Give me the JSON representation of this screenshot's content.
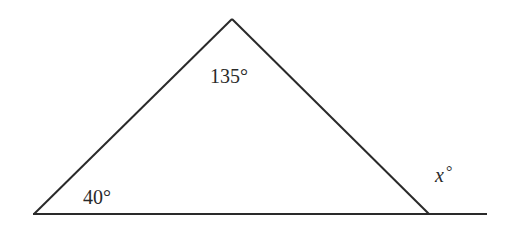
{
  "diagram": {
    "type": "geometry-triangle-exterior-angle",
    "stroke_color": "#2a2a2a",
    "background": "#ffffff",
    "vertices": {
      "apex": [
        232,
        19
      ],
      "bottom_left": [
        34,
        214
      ],
      "bottom_right": [
        429,
        214
      ]
    },
    "baseline_extension_end": [
      487,
      214
    ],
    "labels": {
      "apex_angle": "135°",
      "bottom_left_angle": "40°",
      "exterior_var": "x",
      "exterior_deg": "°"
    }
  }
}
